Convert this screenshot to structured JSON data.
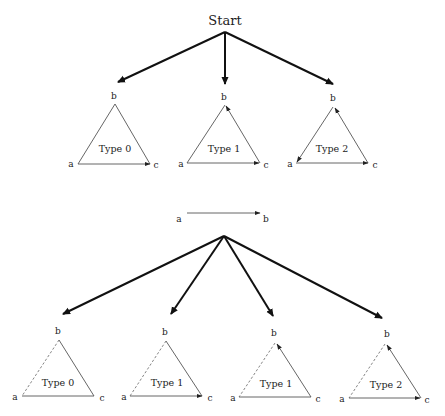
{
  "root": {
    "label": "Start"
  },
  "top_row": [
    {
      "type_label": "Type 0",
      "a": "a",
      "b": "b",
      "c": "c"
    },
    {
      "type_label": "Type 1",
      "a": "a",
      "b": "b",
      "c": "c"
    },
    {
      "type_label": "Type 2",
      "a": "a",
      "b": "b",
      "c": "c"
    }
  ],
  "middle_edge": {
    "from": "a",
    "to": "b"
  },
  "bottom_row": [
    {
      "type_label": "Type 0",
      "a": "a",
      "b": "b",
      "c": "c"
    },
    {
      "type_label": "Type 1",
      "a": "a",
      "b": "b",
      "c": "c"
    },
    {
      "type_label": "Type 1",
      "a": "a",
      "b": "b",
      "c": "c"
    },
    {
      "type_label": "Type 2",
      "a": "a",
      "b": "b",
      "c": "c"
    }
  ],
  "colors": {
    "thick_arrow": "#111111",
    "edge": "#555555",
    "dashed_edge": "#777777"
  }
}
